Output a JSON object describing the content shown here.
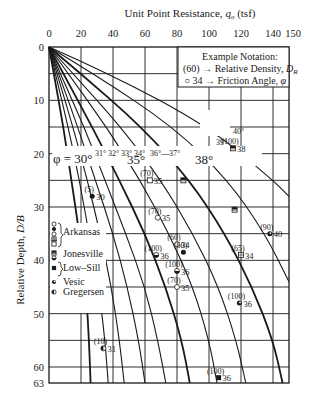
{
  "chart_data": {
    "type": "line",
    "title": "",
    "xlabel": "Unit Point Resistance, q_o (tsf)",
    "ylabel": "Relative Depth, D/B",
    "x_axis_position": "top",
    "y_axis_inverted": true,
    "xlim": [
      0,
      150
    ],
    "ylim": [
      0,
      63
    ],
    "x_ticks": [
      0,
      20,
      40,
      60,
      80,
      100,
      120,
      140,
      150
    ],
    "y_ticks": [
      0,
      10,
      20,
      30,
      40,
      50,
      60,
      63
    ],
    "grid": {
      "x_every": 20,
      "y_every": 5
    },
    "notation_box": {
      "title": "Example Notation:",
      "line1": "(60) → Relative Density, D_R",
      "line2": "○ 34 → Friction Angle, φ"
    },
    "curve_labels": {
      "phi_30": "φ = 30°",
      "small": [
        "31°",
        "32°",
        "33°",
        "34°"
      ],
      "phi_35": "35°",
      "phi_36": "36°",
      "phi_37": "37°",
      "phi_38": "38°",
      "phi_39": "39°",
      "phi_40": "40°"
    },
    "series": [
      {
        "name": "30°",
        "points": [
          [
            0,
            0
          ],
          [
            3,
            5
          ],
          [
            9,
            15
          ],
          [
            14,
            25
          ],
          [
            19,
            35
          ],
          [
            23,
            45
          ],
          [
            25,
            55
          ],
          [
            26,
            63
          ]
        ]
      },
      {
        "name": "31°",
        "points": [
          [
            0,
            0
          ],
          [
            4,
            5
          ],
          [
            12,
            15
          ],
          [
            19,
            25
          ],
          [
            25,
            35
          ],
          [
            31,
            45
          ],
          [
            35,
            55
          ],
          [
            37,
            63
          ]
        ]
      },
      {
        "name": "32°",
        "points": [
          [
            0,
            0
          ],
          [
            5,
            5
          ],
          [
            15,
            15
          ],
          [
            24,
            25
          ],
          [
            32,
            35
          ],
          [
            39,
            45
          ],
          [
            44,
            55
          ],
          [
            47,
            63
          ]
        ]
      },
      {
        "name": "33°",
        "points": [
          [
            0,
            0
          ],
          [
            6,
            5
          ],
          [
            18,
            15
          ],
          [
            29,
            25
          ],
          [
            40,
            35
          ],
          [
            49,
            45
          ],
          [
            56,
            55
          ],
          [
            60,
            63
          ]
        ]
      },
      {
        "name": "34°",
        "points": [
          [
            0,
            0
          ],
          [
            7,
            5
          ],
          [
            22,
            15
          ],
          [
            35,
            25
          ],
          [
            48,
            35
          ],
          [
            60,
            45
          ],
          [
            68,
            55
          ],
          [
            73,
            63
          ]
        ]
      },
      {
        "name": "35°",
        "points": [
          [
            0,
            0
          ],
          [
            9,
            5
          ],
          [
            27,
            15
          ],
          [
            44,
            25
          ],
          [
            60,
            35
          ],
          [
            73,
            45
          ],
          [
            83,
            55
          ],
          [
            88,
            63
          ]
        ]
      },
      {
        "name": "36°",
        "points": [
          [
            0,
            0
          ],
          [
            12,
            5
          ],
          [
            36,
            15
          ],
          [
            57,
            25
          ],
          [
            75,
            35
          ],
          [
            90,
            45
          ],
          [
            100,
            55
          ],
          [
            105,
            63
          ]
        ]
      },
      {
        "name": "37°",
        "points": [
          [
            0,
            0
          ],
          [
            15,
            5
          ],
          [
            45,
            15
          ],
          [
            70,
            25
          ],
          [
            90,
            35
          ],
          [
            106,
            45
          ],
          [
            117,
            55
          ],
          [
            123,
            63
          ]
        ]
      },
      {
        "name": "38°",
        "points": [
          [
            0,
            0
          ],
          [
            20,
            5
          ],
          [
            58,
            15
          ],
          [
            88,
            25
          ],
          [
            110,
            35
          ],
          [
            127,
            45
          ],
          [
            140,
            55
          ],
          [
            146,
            63
          ]
        ]
      },
      {
        "name": "39°",
        "points": [
          [
            0,
            0
          ],
          [
            28,
            5
          ],
          [
            78,
            15
          ],
          [
            112,
            25
          ],
          [
            135,
            35
          ],
          [
            150,
            44
          ]
        ]
      },
      {
        "name": "40°",
        "points": [
          [
            0,
            0
          ],
          [
            38,
            5
          ],
          [
            100,
            15
          ],
          [
            140,
            25
          ],
          [
            150,
            28
          ]
        ]
      }
    ],
    "legend": [
      {
        "symbols": [
          "open-circle",
          "filled-circle"
        ],
        "label": "Arkansas"
      },
      {
        "symbols": [
          "open-square",
          "crossed-square"
        ],
        "label": ""
      },
      {
        "symbols": [
          "half-square"
        ],
        "label": "Jonesville"
      },
      {
        "symbols": [
          "half-circle",
          "filled-square"
        ],
        "label": "Low–Sill"
      },
      {
        "symbols": [
          "dotted-circle"
        ],
        "label": "Vesic"
      },
      {
        "symbols": [
          "half-circle-left"
        ],
        "label": "Gregersen"
      }
    ],
    "data_points": [
      {
        "x": 27,
        "y": 28,
        "dr": "(5)",
        "phi": "30",
        "symbol": "filled-circle"
      },
      {
        "x": 63,
        "y": 25,
        "dr": "(70)",
        "phi": "35",
        "symbol": "open-square"
      },
      {
        "x": 68,
        "y": 32,
        "dr": "(70)",
        "phi": "35",
        "symbol": "open-circle"
      },
      {
        "x": 67,
        "y": 39,
        "dr": "(100)",
        "phi": "36",
        "symbol": "half-circle"
      },
      {
        "x": 80,
        "y": 37,
        "dr": "(60)",
        "phi": "34",
        "symbol": "open-circle"
      },
      {
        "x": 84,
        "y": 38.5,
        "dr": "(60)",
        "phi": "",
        "symbol": "filled-circle"
      },
      {
        "x": 80,
        "y": 42,
        "dr": "(100)",
        "phi": "36",
        "symbol": "half-circle"
      },
      {
        "x": 80,
        "y": 45,
        "dr": "(70)",
        "phi": "35",
        "symbol": "open-circle"
      },
      {
        "x": 115,
        "y": 19,
        "dr": "(100)",
        "phi": "38",
        "symbol": "half-square"
      },
      {
        "x": 84,
        "y": 25,
        "dr": "",
        "phi": "",
        "symbol": "half-square"
      },
      {
        "x": 116,
        "y": 30.5,
        "dr": "",
        "phi": "",
        "symbol": "half-square"
      },
      {
        "x": 138,
        "y": 35,
        "dr": "(90)",
        "phi": "40",
        "symbol": "dotted-circle"
      },
      {
        "x": 120,
        "y": 39,
        "dr": "(65)",
        "phi": "34",
        "symbol": "crossed-square"
      },
      {
        "x": 119,
        "y": 48,
        "dr": "(100)",
        "phi": "36",
        "symbol": "dotted-circle"
      },
      {
        "x": 34,
        "y": 56.5,
        "dr": "(10)",
        "phi": "31",
        "symbol": "half-circle-left"
      },
      {
        "x": 106,
        "y": 62,
        "dr": "(100)",
        "phi": "36",
        "symbol": "filled-square"
      }
    ]
  }
}
